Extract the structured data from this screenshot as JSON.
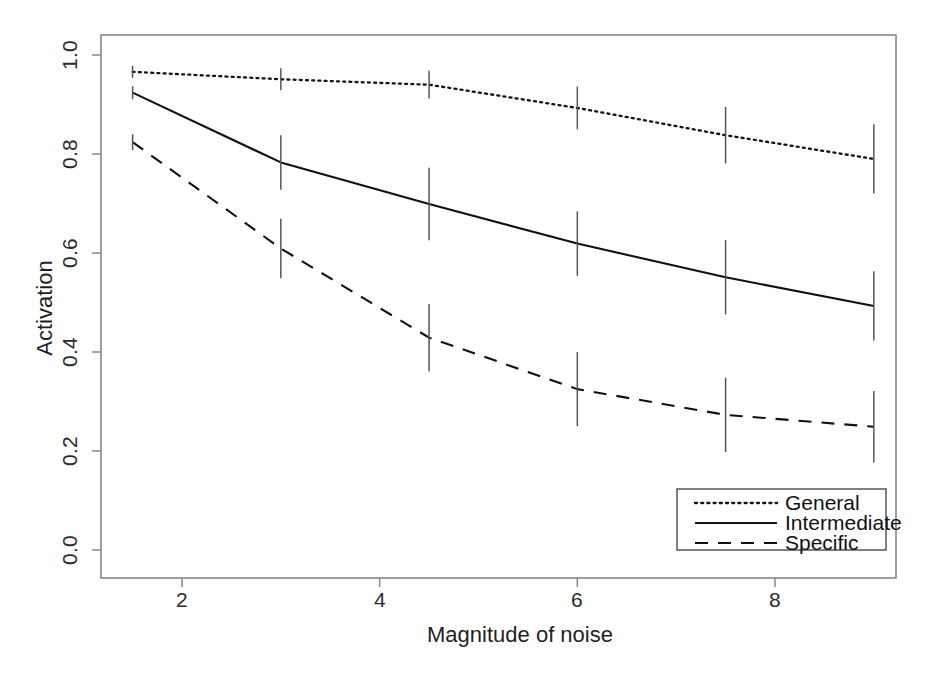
{
  "chart_data": {
    "type": "line",
    "title": "",
    "xlabel": "Magnitude of noise",
    "ylabel": "Activation",
    "x": [
      1.5,
      3,
      4.5,
      6,
      7.5,
      9
    ],
    "xlim": [
      0.6,
      9.65
    ],
    "ylim": [
      0.0,
      1.04
    ],
    "xticks": [
      2,
      4,
      6,
      8
    ],
    "xtick_labels": [
      "2",
      "4",
      "6",
      "8"
    ],
    "yticks": [
      0.0,
      0.2,
      0.4,
      0.6,
      0.8,
      1.0
    ],
    "ytick_labels": [
      "0.0",
      "0.2",
      "0.4",
      "0.6",
      "0.8",
      "1.0"
    ],
    "grid": false,
    "legend_position": "bottom-right",
    "error_bars": true,
    "series": [
      {
        "name": "General",
        "style": "dotted",
        "color": "#111111",
        "values": [
          0.966,
          0.951,
          0.94,
          0.893,
          0.838,
          0.79
        ],
        "errors": [
          0.012,
          0.022,
          0.028,
          0.043,
          0.057,
          0.07
        ]
      },
      {
        "name": "Intermediate",
        "style": "solid",
        "color": "#111111",
        "values": [
          0.924,
          0.783,
          0.699,
          0.619,
          0.551,
          0.493
        ],
        "errors": [
          0.013,
          0.055,
          0.073,
          0.065,
          0.075,
          0.07
        ]
      },
      {
        "name": "Specific",
        "style": "dashed",
        "color": "#111111",
        "values": [
          0.824,
          0.609,
          0.429,
          0.325,
          0.273,
          0.249
        ],
        "errors": [
          0.016,
          0.06,
          0.068,
          0.075,
          0.075,
          0.072
        ]
      }
    ]
  },
  "axes": {
    "x_title": "Magnitude of noise",
    "y_title": "Activation",
    "x_tick_labels": [
      "2",
      "4",
      "6",
      "8"
    ],
    "y_tick_labels": [
      "0.0",
      "0.2",
      "0.4",
      "0.6",
      "0.8",
      "1.0"
    ]
  },
  "legend": {
    "entries": [
      {
        "label": "General",
        "style": "dotted"
      },
      {
        "label": "Intermediate",
        "style": "solid"
      },
      {
        "label": "Specific",
        "style": "dashed"
      }
    ]
  },
  "colors": {
    "line": "#111111",
    "axis": "#888888",
    "background": "#ffffff",
    "text": "#1a1a1a"
  }
}
